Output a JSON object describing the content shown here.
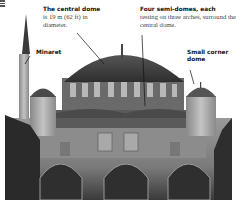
{
  "annotations": {
    "central_dome": {
      "heading": "The central dome",
      "text": "is 19 m (62 ft) in diameter."
    },
    "semi_domes": {
      "heading": "Four semi-domes, each",
      "text": "resting on three arches, surround the central dome."
    },
    "minaret": {
      "heading": "Minaret"
    },
    "corner_dome": {
      "heading": "Small corner dome"
    }
  },
  "image": {
    "subject": "mosque-photograph",
    "tone": "grayscale"
  }
}
